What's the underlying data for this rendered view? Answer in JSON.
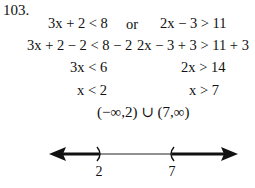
{
  "problem_number": "103.",
  "rows": [
    {
      "left": "3x + 2 < 8",
      "connector": "or",
      "right": "2x − 3 > 11"
    },
    {
      "left": "3x + 2 − 2 < 8 − 2",
      "connector": "",
      "right": "2x − 3 + 3 > 11 + 3"
    },
    {
      "left": "3x < 6",
      "connector": "",
      "right": "2x > 14"
    },
    {
      "left": "x < 2",
      "connector": "",
      "right": "x > 7"
    }
  ],
  "solution_interval": "(−∞,2) ∪ (7,∞)",
  "number_line": {
    "points": [
      {
        "value": "2",
        "bracket": ")",
        "type": "open"
      },
      {
        "value": "7",
        "bracket": "(",
        "type": "open"
      }
    ],
    "shaded": [
      "left of 2",
      "right of 7"
    ]
  }
}
